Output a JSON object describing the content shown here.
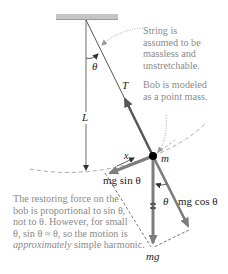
{
  "diagram": {
    "labels": {
      "theta_top": "θ",
      "length": "L",
      "tension": "T",
      "mass": "m",
      "displacement": "x",
      "mg_sin": "mg sin θ",
      "mg_cos": "mg cos θ",
      "theta_bottom": "θ",
      "mg": "mg"
    },
    "notes": {
      "string": [
        "String is",
        "assumed to be",
        "massless and",
        "unstretchable."
      ],
      "bob": [
        "Bob is modeled",
        "as a point mass."
      ],
      "restoring": [
        "The restoring force on the",
        "bob is proportional to sin θ,",
        "not to θ. However, for small",
        "θ, sin θ ≈ θ, so the motion is",
        "approximately",
        " simple harmonic."
      ]
    },
    "colors": {
      "ceiling": "#b8b8b8",
      "string": "#555555",
      "force_arrow": "#7d7d7d",
      "dashed": "#9a9a9a",
      "bob": "#000000",
      "note_text": "#8a8a8a"
    }
  }
}
